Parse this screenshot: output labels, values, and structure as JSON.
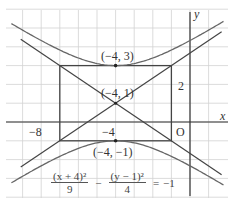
{
  "diagram": {
    "type": "hyperbola-graph",
    "axes": {
      "x_label": "x",
      "y_label": "y",
      "origin_label": "O"
    },
    "tick_labels": {
      "x": [
        "−8",
        "−4"
      ],
      "y": [
        "2"
      ]
    },
    "points": [
      {
        "label": "(−4, 3)",
        "x": -4,
        "y": 3
      },
      {
        "label": "(−4, 1)",
        "x": -4,
        "y": 1
      },
      {
        "label": "(−4, −1)",
        "x": -4,
        "y": -1
      }
    ],
    "rectangle": {
      "x_min": -7,
      "x_max": -1,
      "y_min": -1,
      "y_max": 3
    },
    "asymptotes": [
      "y = 1 + (2/3)(x + 4)",
      "y = 1 − (2/3)(x + 4)"
    ],
    "equation": {
      "term1_num": "(x + 4)²",
      "term1_den": "9",
      "minus": "−",
      "term2_num": "(y − 1)²",
      "term2_den": "4",
      "equals": "=",
      "rhs": "−1"
    },
    "colors": {
      "grid": "#cfcfcf",
      "axis": "#333333",
      "curve": "#6a6a6a",
      "lines": "#444444"
    }
  }
}
